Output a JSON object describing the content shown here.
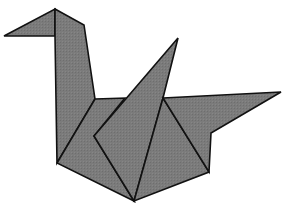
{
  "figure": {
    "fill_color": "#7b7b7b",
    "stroke_color": "#111111",
    "background_color": "#ffffff",
    "stroke_width": 1.6
  }
}
